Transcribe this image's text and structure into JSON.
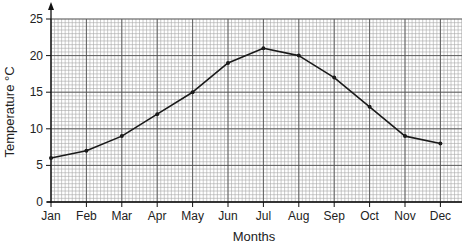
{
  "chart_data": {
    "type": "line",
    "title": "",
    "xlabel": "Months",
    "ylabel": "Temperature °C",
    "categories": [
      "Jan",
      "Feb",
      "Mar",
      "Apr",
      "May",
      "Jun",
      "Jul",
      "Aug",
      "Sep",
      "Oct",
      "Nov",
      "Dec"
    ],
    "series": [
      {
        "name": "Temperature",
        "values": [
          6,
          7,
          9,
          12,
          15,
          19,
          21,
          20,
          17,
          13,
          9,
          8
        ]
      }
    ],
    "ylim": [
      0,
      25
    ],
    "yticks": [
      0,
      5,
      10,
      15,
      20,
      25
    ],
    "grid": true,
    "grid_style": "graph-paper (fine minor grid, major lines every 5 °C and every month)",
    "legend": null
  },
  "colors": {
    "line": "#1a1a1a",
    "major_grid": "#555555",
    "minor_grid": "#a8a8a8",
    "axis": "#111111"
  }
}
